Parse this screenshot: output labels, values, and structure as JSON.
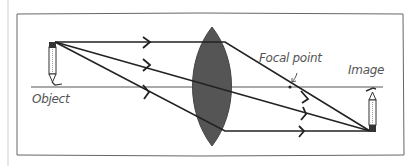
{
  "diagram": {
    "type": "optics-ray-diagram",
    "labels": {
      "object": "Object",
      "focal_point": "Focal point",
      "image": "Image"
    },
    "elements": {
      "lens": {
        "shape": "biconvex",
        "fill": "#555555"
      },
      "optical_axis": {
        "color": "#444444"
      },
      "rays": [
        {
          "name": "parallel-ray",
          "from": "object-tip",
          "via": "focal-point",
          "to": "image-tip"
        },
        {
          "name": "center-ray",
          "from": "object-tip",
          "via": "lens-center",
          "to": "image-tip"
        },
        {
          "name": "focal-ray",
          "from": "object-tip",
          "via": "near-focal-point",
          "to": "image-tip",
          "exits": "parallel"
        }
      ],
      "object_pencil": {
        "orientation": "upright"
      },
      "image_pencil": {
        "orientation": "inverted"
      }
    },
    "colors": {
      "ray": "#222222",
      "lens": "#555555",
      "frame": "#666666",
      "text": "#555555"
    }
  }
}
